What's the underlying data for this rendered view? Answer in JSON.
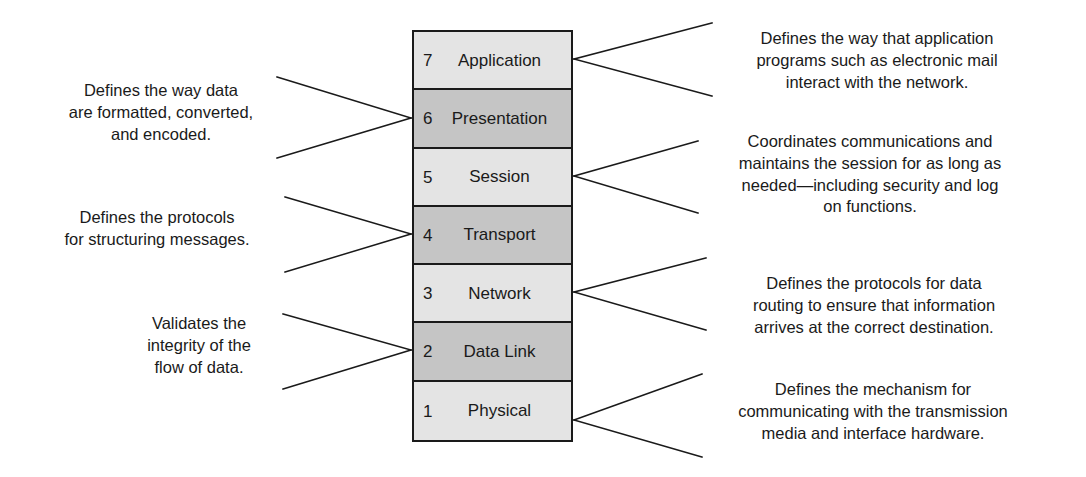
{
  "diagram": {
    "colors": {
      "light_layer": "#e4e4e4",
      "dark_layer": "#c5c5c5",
      "outline": "#1a1a1a",
      "text": "#1a1a1a",
      "background": "#ffffff"
    }
  },
  "stack": {
    "layers": [
      {
        "number": "7",
        "name": "Application",
        "shade": "light"
      },
      {
        "number": "6",
        "name": "Presentation",
        "shade": "dark"
      },
      {
        "number": "5",
        "name": "Session",
        "shade": "light"
      },
      {
        "number": "4",
        "name": "Transport",
        "shade": "dark"
      },
      {
        "number": "3",
        "name": "Network",
        "shade": "light"
      },
      {
        "number": "2",
        "name": "Data Link",
        "shade": "dark"
      },
      {
        "number": "1",
        "name": "Physical",
        "shade": "light"
      }
    ]
  },
  "annotations": {
    "left": [
      {
        "layer": "6",
        "text": "Defines the way data\nare formatted, converted,\nand encoded."
      },
      {
        "layer": "4",
        "text": "Defines the protocols\nfor structuring messages."
      },
      {
        "layer": "2",
        "text": "Validates the\nintegrity of the\nflow of data."
      }
    ],
    "right": [
      {
        "layer": "7",
        "text": "Defines the way that application\nprograms such as electronic mail\ninteract with the network."
      },
      {
        "layer": "5",
        "text": "Coordinates communications and\nmaintains the session for as long as\nneeded—including security and log\non functions."
      },
      {
        "layer": "3",
        "text": "Defines the protocols for data\nrouting to ensure that information\narrives at the correct destination."
      },
      {
        "layer": "1",
        "text": "Defines the mechanism for\ncommunicating with the transmission\nmedia and interface hardware."
      }
    ]
  }
}
